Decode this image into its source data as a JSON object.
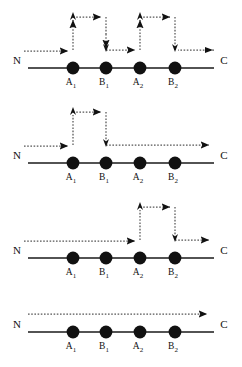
{
  "figure": {
    "type": "diagram",
    "terminus_left_label": "N",
    "terminus_right_label": "C",
    "residue_labels": [
      "A",
      "B",
      "A",
      "B"
    ],
    "residue_subscripts": [
      "1",
      "1",
      "2",
      "2"
    ],
    "colors": {
      "background": "#ffffff",
      "chain_line": "#1a1a1a",
      "residue_fill": "#111111",
      "dotted_path": "#4d4d4d",
      "arrowhead": "#111111",
      "label_text": "#111111"
    },
    "panels": [
      {
        "id": "panel-1",
        "name": "double-loop",
        "loops": [
          "A1-B1",
          "A2-B2"
        ],
        "entry": "N",
        "exit_direction": "leftward-into-C"
      },
      {
        "id": "panel-2",
        "name": "first-loop-only",
        "loops": [
          "A1-B1"
        ],
        "entry": "N",
        "exit_direction": "rightward-to-C"
      },
      {
        "id": "panel-3",
        "name": "second-loop-only",
        "loops": [
          "A2-B2"
        ],
        "entry": "N",
        "exit_direction": "rightward-to-C"
      },
      {
        "id": "panel-4",
        "name": "no-loop",
        "loops": [],
        "entry": "N",
        "exit_direction": "rightward-to-C"
      }
    ]
  }
}
